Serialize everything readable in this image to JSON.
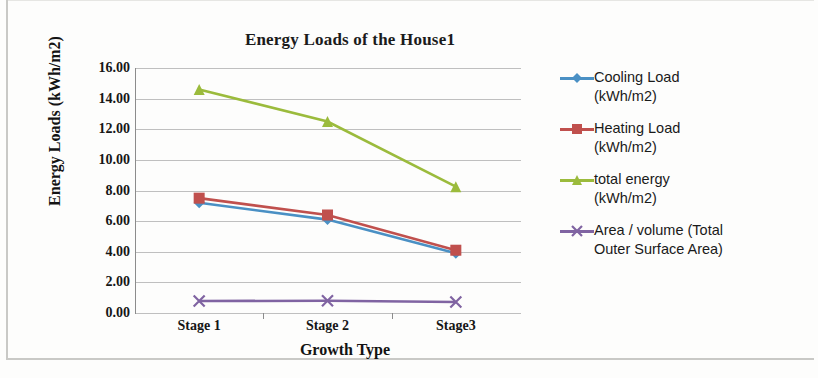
{
  "chart_data": {
    "type": "line",
    "title": "Energy Loads of the House1",
    "xlabel": "Growth Type",
    "ylabel": "Energy Loads  (kWh/m2)",
    "categories": [
      "Stage 1",
      "Stage 2",
      "Stage3"
    ],
    "ylim": [
      0,
      16
    ],
    "ytick_step": 2,
    "ytick_labels": [
      "16.00",
      "14.00",
      "12.00",
      "10.00",
      "8.00",
      "6.00",
      "4.00",
      "2.00",
      "0.00"
    ],
    "ytick_values": [
      16,
      14,
      12,
      10,
      8,
      6,
      4,
      2,
      0
    ],
    "grid": true,
    "legend_position": "right",
    "series": [
      {
        "name": "Cooling Load (kWh/m2)",
        "legend_line1": "Cooling Load",
        "legend_line2": "(kWh/m2)",
        "color": "#4a90c4",
        "marker": "diamond",
        "values": [
          7.2,
          6.1,
          3.9
        ]
      },
      {
        "name": "Heating Load (kWh/m2)",
        "legend_line1": "Heating Load",
        "legend_line2": "(kWh/m2)",
        "color": "#c0504d",
        "marker": "square",
        "values": [
          7.5,
          6.4,
          4.1
        ]
      },
      {
        "name": "total energy (kWh/m2)",
        "legend_line1": "total energy",
        "legend_line2": "(kWh/m2)",
        "color": "#9bbb3c",
        "marker": "triangle",
        "values": [
          14.6,
          12.5,
          8.25
        ]
      },
      {
        "name": "Area / volume (Total Outer Surface Area)",
        "legend_line1": "Area / volume (Total",
        "legend_line2": "Outer Surface Area)",
        "color": "#8064a2",
        "marker": "x",
        "values": [
          0.78,
          0.8,
          0.72
        ]
      }
    ]
  }
}
